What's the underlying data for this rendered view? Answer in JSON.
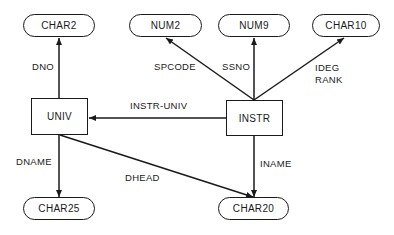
{
  "diagram": {
    "type": "entity-attribute diagram",
    "entities": [
      {
        "id": "univ",
        "label": "UNIV"
      },
      {
        "id": "instr",
        "label": "INSTR"
      }
    ],
    "domains": [
      {
        "id": "char2",
        "label": "CHAR2"
      },
      {
        "id": "num2",
        "label": "NUM2"
      },
      {
        "id": "num9",
        "label": "NUM9"
      },
      {
        "id": "char10",
        "label": "CHAR10"
      },
      {
        "id": "char25",
        "label": "CHAR25"
      },
      {
        "id": "char20",
        "label": "CHAR20"
      }
    ],
    "edges": [
      {
        "from": "UNIV",
        "to": "CHAR2",
        "label": "DNO"
      },
      {
        "from": "INSTR",
        "to": "NUM2",
        "label": "SPCODE"
      },
      {
        "from": "INSTR",
        "to": "NUM9",
        "label": "SSNO"
      },
      {
        "from": "INSTR",
        "to": "CHAR10",
        "label_line1": "IDEG",
        "label_line2": "RANK"
      },
      {
        "from": "INSTR",
        "to": "UNIV",
        "label": "INSTR-UNIV"
      },
      {
        "from": "UNIV",
        "to": "CHAR25",
        "label": "DNAME"
      },
      {
        "from": "UNIV",
        "to": "CHAR20",
        "label": "DHEAD"
      },
      {
        "from": "INSTR",
        "to": "CHAR20",
        "label": "INAME"
      }
    ]
  }
}
